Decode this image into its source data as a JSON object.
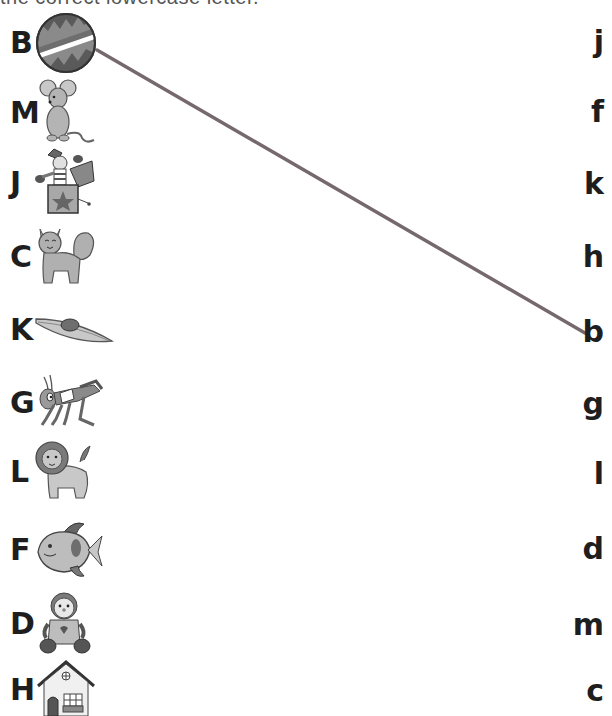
{
  "instruction": "the correct lowercase letter.",
  "left_items": [
    {
      "letter": "B",
      "picture": "ball",
      "y": 43
    },
    {
      "letter": "M",
      "picture": "mouse",
      "y": 113
    },
    {
      "letter": "J",
      "picture": "jack-in-the-box",
      "y": 183
    },
    {
      "letter": "C",
      "picture": "cat",
      "y": 257
    },
    {
      "letter": "K",
      "picture": "kayak",
      "y": 330
    },
    {
      "letter": "G",
      "picture": "grasshopper",
      "y": 403
    },
    {
      "letter": "L",
      "picture": "lion",
      "y": 472
    },
    {
      "letter": "F",
      "picture": "fish",
      "y": 550
    },
    {
      "letter": "D",
      "picture": "doll",
      "y": 624
    },
    {
      "letter": "H",
      "picture": "house",
      "y": 690
    }
  ],
  "right_items": [
    {
      "letter": "j",
      "y": 43
    },
    {
      "letter": "f",
      "y": 113
    },
    {
      "letter": "k",
      "y": 185
    },
    {
      "letter": "h",
      "y": 258
    },
    {
      "letter": "b",
      "y": 333
    },
    {
      "letter": "g",
      "y": 405
    },
    {
      "letter": "l",
      "y": 475
    },
    {
      "letter": "d",
      "y": 550
    },
    {
      "letter": "m",
      "y": 626
    },
    {
      "letter": "c",
      "y": 692
    }
  ],
  "connections": [
    {
      "from": "B",
      "to": "b",
      "x1": 97,
      "y1": 50,
      "x2": 585,
      "y2": 333,
      "color": "#76696e"
    }
  ]
}
